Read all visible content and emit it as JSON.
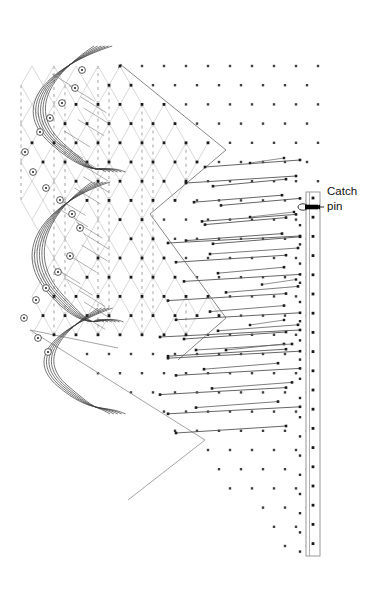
{
  "figure": {
    "domain": "diagram",
    "background_color": "#ffffff",
    "width": 377,
    "height": 600
  },
  "annotations": [
    {
      "id": "catch-pin",
      "line1": "Catch",
      "line2": "pin",
      "text_x": 327,
      "text_y": 192,
      "leader_from_x": 324,
      "leader_from_y": 207,
      "leader_to_x": 314,
      "leader_to_y": 207,
      "color": "#111111"
    }
  ],
  "colors": {
    "thread_dark": "#3a3a3a",
    "thread_mid": "#6d6d6d",
    "mesh_light": "#c9c9c9",
    "mesh_dash": "#b4b4b4",
    "knot_dot": "#1a1a1a",
    "grid_dot": "#2b2b2b",
    "bar_line": "#8e8e8e",
    "marker_ring": "#333333",
    "arrow_fill": "#000000",
    "label_text": "#111111",
    "chevron_edge": "#9a9a9a"
  },
  "lattice": {
    "description": "staggered triangular point lattice of knots",
    "dx": 22,
    "dy": 19.2,
    "origin_x": 10,
    "origin_y": 66,
    "cols": 15,
    "rows": 28,
    "knot_radius": 1.5
  },
  "catch_pin_bar": {
    "name": "catch-pin-bar",
    "x_left": 306,
    "x_right": 320,
    "y_top": 192,
    "y_bottom": 556,
    "inner_dot_x": 313,
    "outer_dot_x": 300,
    "dot_spacing": 19.2,
    "pin_marker_y": 207,
    "pin_marker_rx": 5,
    "pin_marker_ry": 3.2
  },
  "edge_markers": {
    "name": "bobbin-position-markers",
    "radius": 3.4,
    "count": 18,
    "note": "small numbered rings along the left selvedge of each chevron"
  },
  "zones": [
    {
      "name": "knitted-mesh-zone",
      "label": "formed net / closed mesh",
      "region": "upper-left chevrons"
    },
    {
      "name": "thread-traverse-zone",
      "label": "yarn traverse lines to catch pins",
      "region": "middle band"
    },
    {
      "name": "open-pin-field-zone",
      "label": "bare pin field",
      "region": "lower triangle"
    }
  ],
  "chevrons": [
    {
      "name": "chevron-upper",
      "apex_x": 223,
      "apex_y": 150,
      "top_y": 66
    },
    {
      "name": "chevron-middle",
      "apex_x": 223,
      "apex_y": 318,
      "top_y": 206
    },
    {
      "name": "chevron-lower",
      "apex_x": 205,
      "apex_y": 440,
      "top_y": 345
    }
  ]
}
